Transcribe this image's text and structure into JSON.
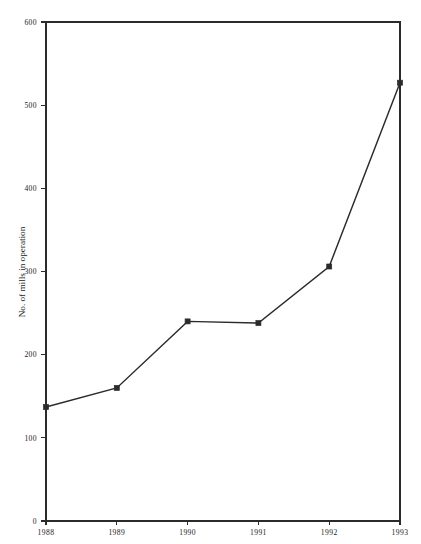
{
  "chart_data": {
    "type": "line",
    "title": "",
    "subtitle": "",
    "xlabel": "",
    "ylabel": "No. of mills in operation",
    "categories": [
      "1988",
      "1989",
      "1990",
      "1991",
      "1992",
      "1993"
    ],
    "x": [
      1988,
      1989,
      1990,
      1991,
      1992,
      1993
    ],
    "values": [
      137,
      160,
      240,
      238,
      306,
      527
    ],
    "series": [
      {
        "name": "No. of mills in operation",
        "values": [
          137,
          160,
          240,
          238,
          306,
          527
        ]
      }
    ],
    "ylim": [
      0,
      600
    ],
    "yticks": [
      0,
      100,
      200,
      300,
      400,
      500,
      600
    ],
    "ytick_labels": [
      "0",
      "100",
      "200",
      "300",
      "400",
      "500",
      "600"
    ],
    "xtick_labels": [
      "1988",
      "1989",
      "1990",
      "1991",
      "1992",
      "1993"
    ],
    "grid": false,
    "legend": false,
    "legend_position": "none",
    "marker": "square",
    "line_color": "#2b2b2b",
    "marker_color": "#2b2b2b",
    "background_color": "#ffffff",
    "axis_color": "#2b2b2b",
    "frame": "box"
  }
}
